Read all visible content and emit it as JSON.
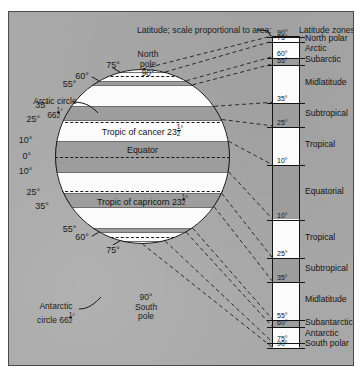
{
  "figure": {
    "caption": "Latitude; scale proportional to area:",
    "zones_heading": "Latitude zones:"
  },
  "globe": {
    "north_pole_label": "North\npole\n90°",
    "south_pole_label": "90°\nSouth\npole",
    "arctic_circle_label": "Arctic circle\n66½°",
    "antarctic_circle_label": "Antarctic\ncircle 66½°",
    "band_labels": [
      {
        "text": "Tropic of cancer 23½°",
        "lat": 23.5
      },
      {
        "text": "Equator",
        "lat": 0
      },
      {
        "text": "Tropic of capricorn 23½°",
        "lat": -23.5
      }
    ],
    "edge_ticks_north": [
      "75°",
      "60°",
      "55°",
      "35°",
      "25°",
      "10°",
      "0°"
    ],
    "edge_ticks_south": [
      "10°",
      "25°",
      "35°",
      "55°",
      "60°",
      "75°"
    ],
    "boundary_latitudes": [
      10,
      25,
      35,
      55,
      60,
      75
    ],
    "dashed_latitudes": [
      66.5,
      23.5,
      0,
      -23.5,
      -66.5
    ]
  },
  "scale": {
    "hemisphere_north": "N",
    "hemisphere_south": "S",
    "ticks": [
      {
        "label": "90°",
        "lat": 90
      },
      {
        "label": "75°",
        "lat": 75
      },
      {
        "label": "60°",
        "lat": 60
      },
      {
        "label": "55°",
        "lat": 55
      },
      {
        "label": "35°",
        "lat": 35
      },
      {
        "label": "25°",
        "lat": 25
      },
      {
        "label": "10°",
        "lat": 10
      },
      {
        "label": "10°",
        "lat": -10
      },
      {
        "label": "25°",
        "lat": -25
      },
      {
        "label": "35°",
        "lat": -35
      },
      {
        "label": "55°",
        "lat": -55
      },
      {
        "label": "60°",
        "lat": -60
      },
      {
        "label": "75°",
        "lat": -75
      },
      {
        "label": "90°",
        "lat": -90
      }
    ],
    "zones": [
      {
        "name": "North polar",
        "from": 90,
        "to": 75,
        "shade": "white"
      },
      {
        "name": "Arctic",
        "from": 75,
        "to": 60,
        "shade": "white"
      },
      {
        "name": "Subarctic",
        "from": 60,
        "to": 55,
        "shade": "gray"
      },
      {
        "name": "Midlatitude",
        "from": 55,
        "to": 35,
        "shade": "white"
      },
      {
        "name": "Subtropical",
        "from": 35,
        "to": 25,
        "shade": "gray"
      },
      {
        "name": "Tropical",
        "from": 25,
        "to": 10,
        "shade": "white"
      },
      {
        "name": "Equatorial",
        "from": 10,
        "to": -10,
        "shade": "gray"
      },
      {
        "name": "Tropical",
        "from": -10,
        "to": -25,
        "shade": "white"
      },
      {
        "name": "Subtropical",
        "from": -25,
        "to": -35,
        "shade": "gray"
      },
      {
        "name": "Midlatitude",
        "from": -35,
        "to": -55,
        "shade": "white"
      },
      {
        "name": "Subantarctic",
        "from": -55,
        "to": -60,
        "shade": "gray"
      },
      {
        "name": "Antarctic",
        "from": -60,
        "to": -75,
        "shade": "white"
      },
      {
        "name": "South polar",
        "from": -75,
        "to": -90,
        "shade": "white"
      }
    ]
  },
  "colors": {
    "plate_background": "#a8a8a8",
    "band_gray": "#9d9d9d",
    "band_white": "#fbfbfb",
    "ink": "#141414",
    "frame": "#4a4a4a"
  }
}
